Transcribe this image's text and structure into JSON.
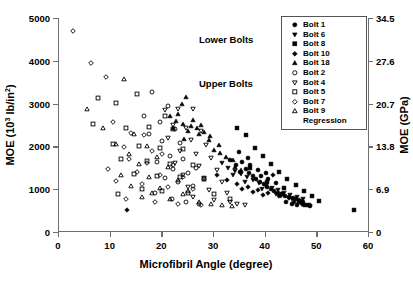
{
  "chart_data": {
    "type": "scatter",
    "title": "",
    "xlabel": "Microfibril Angle (degree)",
    "ylabel": "MOE (10³ lb/in²)",
    "ylabel_right": "MOE (GPa)",
    "xlim": [
      0,
      60
    ],
    "ylim": [
      0,
      5000
    ],
    "ylim_right": [
      0,
      34.5
    ],
    "xticks": [
      "0",
      "10",
      "20",
      "30",
      "40",
      "50",
      "60"
    ],
    "xtick_values": [
      0,
      10,
      20,
      30,
      40,
      50,
      60
    ],
    "yticks": [
      "0",
      "1000",
      "2000",
      "3000",
      "4000",
      "5000"
    ],
    "ytick_values": [
      0,
      1000,
      2000,
      3000,
      4000,
      5000
    ],
    "yticks_right": [
      "0",
      "6.9",
      "13.8",
      "20.7",
      "27.6",
      "34.5"
    ],
    "ytick_values_right": [
      0,
      6.9,
      13.8,
      20.7,
      27.6,
      34.5
    ],
    "grid": false,
    "legend_position": "top-right",
    "annotations": [
      {
        "text": "Lower Bolts",
        "x": 27.5,
        "y": 4480
      },
      {
        "text": "Upper Bolts",
        "x": 27.5,
        "y": 3450
      }
    ],
    "series": [
      {
        "name": "Bolt 1",
        "marker": "circle",
        "fill": "solid",
        "points": [
          [
            33.0,
            1680
          ],
          [
            34.2,
            1560
          ],
          [
            35.4,
            1640
          ],
          [
            36.1,
            1480
          ],
          [
            36.8,
            1390
          ],
          [
            37.5,
            1300
          ],
          [
            38.2,
            1240
          ],
          [
            38.9,
            1180
          ],
          [
            39.6,
            1120
          ],
          [
            40.3,
            1060
          ],
          [
            41.0,
            1010
          ],
          [
            41.7,
            960
          ],
          [
            42.4,
            915
          ],
          [
            43.1,
            880
          ],
          [
            43.8,
            845
          ],
          [
            44.5,
            810
          ],
          [
            45.2,
            790
          ],
          [
            45.9,
            760
          ],
          [
            46.6,
            735
          ],
          [
            47.3,
            710
          ],
          [
            39.0,
            1310
          ],
          [
            40.5,
            1230
          ],
          [
            42.0,
            1150
          ],
          [
            34.8,
            1870
          ],
          [
            36.5,
            1720
          ],
          [
            44.0,
            700
          ],
          [
            45.0,
            660
          ],
          [
            46.0,
            640
          ],
          [
            47.5,
            620
          ],
          [
            48.5,
            600
          ],
          [
            35.0,
            1410
          ],
          [
            37.0,
            1560
          ],
          [
            38.5,
            1450
          ],
          [
            40.0,
            1390
          ]
        ]
      },
      {
        "name": "Bolt 6",
        "marker": "triangle-down",
        "fill": "solid",
        "points": [
          [
            32.8,
            1490
          ],
          [
            34.0,
            1420
          ],
          [
            35.2,
            1360
          ],
          [
            36.4,
            1290
          ],
          [
            37.6,
            1220
          ],
          [
            38.8,
            1150
          ],
          [
            40.0,
            1080
          ],
          [
            41.2,
            1020
          ],
          [
            42.4,
            970
          ],
          [
            43.6,
            920
          ],
          [
            44.8,
            870
          ],
          [
            46.0,
            820
          ],
          [
            47.2,
            780
          ],
          [
            33.6,
            1330
          ],
          [
            36.0,
            1180
          ],
          [
            39.2,
            1000
          ],
          [
            42.0,
            880
          ],
          [
            45.0,
            760
          ],
          [
            31.5,
            1620
          ],
          [
            43.0,
            830
          ]
        ]
      },
      {
        "name": "Bolt 8",
        "marker": "square",
        "fill": "solid",
        "points": [
          [
            34.5,
            2430
          ],
          [
            36.2,
            2260
          ],
          [
            38.0,
            1960
          ],
          [
            39.4,
            1780
          ],
          [
            41.0,
            1580
          ],
          [
            42.6,
            1400
          ],
          [
            44.2,
            1250
          ],
          [
            45.8,
            1100
          ],
          [
            47.4,
            960
          ],
          [
            49.0,
            830
          ],
          [
            50.4,
            720
          ],
          [
            57.0,
            520
          ],
          [
            43.5,
            1020
          ],
          [
            46.5,
            700
          ],
          [
            48.0,
            640
          ],
          [
            40.2,
            1180
          ],
          [
            37.0,
            1500
          ]
        ]
      },
      {
        "name": "Bolt 10",
        "marker": "diamond",
        "fill": "solid",
        "points": [
          [
            13.2,
            520
          ],
          [
            30.5,
            1340
          ],
          [
            32.5,
            1220
          ],
          [
            34.5,
            1130
          ],
          [
            36.5,
            1040
          ],
          [
            38.5,
            970
          ],
          [
            40.5,
            900
          ],
          [
            42.5,
            840
          ],
          [
            44.5,
            790
          ],
          [
            46.5,
            740
          ],
          [
            41.5,
            1330
          ],
          [
            43.0,
            880
          ],
          [
            45.5,
            700
          ],
          [
            47.0,
            660
          ],
          [
            48.5,
            630
          ],
          [
            35.5,
            1000
          ],
          [
            37.5,
            930
          ],
          [
            39.5,
            870
          ]
        ]
      },
      {
        "name": "Bolt 18",
        "marker": "triangle-up",
        "fill": "solid",
        "points": [
          [
            24.5,
            3150
          ],
          [
            23.8,
            2980
          ],
          [
            22.6,
            2600
          ],
          [
            24.0,
            2530
          ],
          [
            25.5,
            2480
          ],
          [
            26.8,
            2420
          ],
          [
            28.0,
            2330
          ],
          [
            29.2,
            2240
          ],
          [
            21.5,
            2700
          ],
          [
            23.0,
            2750
          ],
          [
            26.0,
            2620
          ],
          [
            27.5,
            2500
          ],
          [
            30.0,
            1920
          ],
          [
            31.2,
            1840
          ],
          [
            32.4,
            1760
          ],
          [
            33.6,
            1680
          ],
          [
            25.0,
            2350
          ],
          [
            27.0,
            2280
          ],
          [
            29.0,
            2150
          ],
          [
            31.0,
            2040
          ],
          [
            22.0,
            2440
          ],
          [
            24.2,
            2180
          ],
          [
            34.0,
            1520
          ],
          [
            35.2,
            1440
          ]
        ]
      },
      {
        "name": "Bolt 2",
        "marker": "circle",
        "fill": "open",
        "points": [
          [
            18.0,
            3280
          ],
          [
            21.0,
            2940
          ],
          [
            19.5,
            2560
          ],
          [
            22.5,
            2400
          ],
          [
            20.0,
            2120
          ],
          [
            23.5,
            2080
          ],
          [
            17.5,
            2300
          ],
          [
            21.5,
            1780
          ],
          [
            24.0,
            1700
          ],
          [
            19.0,
            1640
          ],
          [
            22.0,
            1480
          ],
          [
            25.0,
            1380
          ],
          [
            20.5,
            1260
          ],
          [
            23.0,
            1160
          ],
          [
            26.0,
            1080
          ],
          [
            18.5,
            900
          ],
          [
            21.8,
            760
          ],
          [
            24.5,
            700
          ],
          [
            27.0,
            650
          ],
          [
            16.5,
            2700
          ],
          [
            26.5,
            1500
          ],
          [
            28.0,
            1240
          ]
        ]
      },
      {
        "name": "Bolt 4",
        "marker": "triangle-down",
        "fill": "open",
        "points": [
          [
            20.5,
            2840
          ],
          [
            23.0,
            2880
          ],
          [
            26.0,
            2880
          ],
          [
            22.0,
            2500
          ],
          [
            24.5,
            2440
          ],
          [
            27.5,
            2350
          ],
          [
            21.0,
            2200
          ],
          [
            25.5,
            2150
          ],
          [
            28.5,
            2040
          ],
          [
            23.5,
            1900
          ],
          [
            26.5,
            1820
          ],
          [
            29.5,
            1740
          ],
          [
            22.5,
            1620
          ],
          [
            27.0,
            1540
          ],
          [
            30.5,
            1460
          ],
          [
            24.0,
            1340
          ],
          [
            28.0,
            1260
          ],
          [
            31.5,
            1180
          ],
          [
            25.0,
            1060
          ],
          [
            29.0,
            980
          ],
          [
            32.5,
            900
          ],
          [
            26.0,
            820
          ],
          [
            30.0,
            750
          ],
          [
            33.0,
            700
          ],
          [
            34.5,
            660
          ],
          [
            36.0,
            640
          ]
        ]
      },
      {
        "name": "Bolt 5",
        "marker": "square",
        "fill": "open",
        "points": [
          [
            7.5,
            3130
          ],
          [
            11.0,
            3020
          ],
          [
            15.0,
            3220
          ],
          [
            20.5,
            2720
          ],
          [
            6.5,
            2520
          ],
          [
            13.0,
            2440
          ],
          [
            17.5,
            2460
          ],
          [
            22.0,
            2400
          ],
          [
            10.5,
            2060
          ],
          [
            15.5,
            2000
          ],
          [
            19.5,
            1960
          ],
          [
            24.0,
            1940
          ],
          [
            12.0,
            1700
          ],
          [
            17.0,
            1660
          ],
          [
            21.5,
            1600
          ],
          [
            26.0,
            1560
          ],
          [
            14.5,
            1360
          ],
          [
            19.0,
            1320
          ],
          [
            23.5,
            1280
          ],
          [
            28.0,
            1240
          ],
          [
            16.0,
            1000
          ],
          [
            20.0,
            960
          ],
          [
            25.0,
            920
          ],
          [
            30.0,
            880
          ],
          [
            11.5,
            880
          ],
          [
            33.0,
            760
          ]
        ]
      },
      {
        "name": "Bolt 7",
        "marker": "diamond",
        "fill": "open",
        "points": [
          [
            2.8,
            4700
          ],
          [
            6.2,
            3940
          ],
          [
            9.0,
            3630
          ],
          [
            10.5,
            2560
          ],
          [
            14.0,
            2320
          ],
          [
            16.5,
            2260
          ],
          [
            12.5,
            1980
          ],
          [
            18.0,
            1900
          ],
          [
            20.0,
            1820
          ],
          [
            13.5,
            1700
          ],
          [
            17.0,
            1620
          ],
          [
            22.0,
            1560
          ],
          [
            15.0,
            1400
          ],
          [
            19.5,
            1340
          ],
          [
            24.0,
            1280
          ],
          [
            11.0,
            1200
          ],
          [
            16.0,
            1120
          ],
          [
            21.0,
            1060
          ],
          [
            26.0,
            1000
          ],
          [
            13.0,
            760
          ],
          [
            18.5,
            700
          ],
          [
            23.0,
            660
          ],
          [
            27.5,
            640
          ],
          [
            9.5,
            1480
          ]
        ]
      },
      {
        "name": "Bolt 9",
        "marker": "triangle-up",
        "fill": "open",
        "points": [
          [
            5.5,
            2880
          ],
          [
            12.5,
            3570
          ],
          [
            8.5,
            2420
          ],
          [
            14.5,
            2280
          ],
          [
            11.0,
            2060
          ],
          [
            17.0,
            2000
          ],
          [
            13.5,
            1820
          ],
          [
            19.0,
            1760
          ],
          [
            15.5,
            1580
          ],
          [
            21.0,
            1520
          ],
          [
            12.0,
            1340
          ],
          [
            17.5,
            1280
          ],
          [
            23.0,
            1220
          ],
          [
            14.0,
            1080
          ],
          [
            19.5,
            1020
          ],
          [
            25.0,
            960
          ],
          [
            16.0,
            820
          ],
          [
            21.5,
            760
          ],
          [
            27.0,
            700
          ],
          [
            29.5,
            660
          ],
          [
            31.5,
            620
          ],
          [
            33.5,
            600
          ],
          [
            24.0,
            880
          ],
          [
            18.0,
            900
          ]
        ]
      }
    ],
    "legend": [
      {
        "label": "Bolt 1",
        "marker": "circle",
        "fill": "solid"
      },
      {
        "label": "Bolt 6",
        "marker": "triangle-down",
        "fill": "solid"
      },
      {
        "label": "Bolt 8",
        "marker": "square",
        "fill": "solid"
      },
      {
        "label": "Bolt 10",
        "marker": "diamond",
        "fill": "solid"
      },
      {
        "label": "Bolt 18",
        "marker": "triangle-up",
        "fill": "solid"
      },
      {
        "label": "Bolt 2",
        "marker": "circle",
        "fill": "open"
      },
      {
        "label": "Bolt 4",
        "marker": "triangle-down",
        "fill": "open"
      },
      {
        "label": "Bolt 5",
        "marker": "square",
        "fill": "open"
      },
      {
        "label": "Bolt 7",
        "marker": "diamond",
        "fill": "open"
      },
      {
        "label": "Bolt 9",
        "marker": "triangle-up",
        "fill": "open"
      },
      {
        "label": "Regression",
        "marker": "none",
        "fill": "none"
      }
    ]
  }
}
